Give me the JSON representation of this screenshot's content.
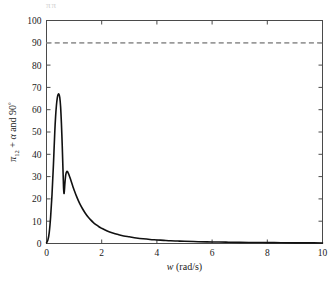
{
  "figure": {
    "top_artifact_text": "ππ",
    "background_color": "#ffffff"
  },
  "chart_data": {
    "type": "line",
    "title": "",
    "xlabel": "w (rad/s)",
    "xlabel_parts": {
      "symbol": "w",
      "unit": "(rad/s)"
    },
    "ylabel": "π12 + α and 90°",
    "ylabel_parts": {
      "pi": "π",
      "subscript": "12",
      "plus": " + ",
      "alpha": "α",
      "and": " and ",
      "ninety": "90",
      "degree": "°"
    },
    "xlim": [
      0,
      10
    ],
    "ylim": [
      0,
      100
    ],
    "xticks": [
      0,
      2,
      4,
      6,
      8,
      10
    ],
    "yticks": [
      0,
      10,
      20,
      30,
      40,
      50,
      60,
      70,
      80,
      90,
      100
    ],
    "xticklabels": [
      "0",
      "2",
      "4",
      "6",
      "8",
      "10"
    ],
    "yticklabels": [
      "0",
      "10",
      "20",
      "30",
      "40",
      "50",
      "60",
      "70",
      "80",
      "90",
      "100"
    ],
    "grid": false,
    "legend": null,
    "series": [
      {
        "name": "π12 + α",
        "style": "solid",
        "color": "#111111",
        "linewidth": 1.6,
        "x": [
          0.0,
          0.05,
          0.1,
          0.15,
          0.2,
          0.25,
          0.3,
          0.33,
          0.36,
          0.39,
          0.42,
          0.45,
          0.48,
          0.51,
          0.54,
          0.57,
          0.59,
          0.61,
          0.62,
          0.635,
          0.65,
          0.67,
          0.7,
          0.74,
          0.78,
          0.82,
          0.86,
          0.9,
          0.95,
          1.0,
          1.1,
          1.2,
          1.3,
          1.4,
          1.5,
          1.6,
          1.7,
          1.8,
          1.9,
          2.0,
          2.2,
          2.4,
          2.6,
          2.8,
          3.0,
          3.25,
          3.5,
          3.75,
          4.0,
          4.25,
          4.5,
          4.75,
          5.0,
          5.5,
          6.0,
          6.5,
          7.0,
          7.5,
          8.0,
          8.5,
          9.0,
          9.5,
          10.0
        ],
        "y": [
          0.3,
          1.5,
          5.0,
          12.0,
          22.0,
          35.0,
          50.0,
          57.0,
          62.0,
          65.2,
          66.8,
          67.0,
          65.5,
          61.5,
          54.0,
          44.0,
          36.0,
          28.0,
          24.5,
          22.4,
          24.0,
          27.5,
          31.0,
          32.3,
          31.8,
          30.6,
          29.2,
          27.7,
          25.8,
          24.0,
          20.8,
          18.0,
          15.7,
          13.7,
          12.0,
          10.6,
          9.4,
          8.4,
          7.5,
          6.8,
          5.6,
          4.7,
          4.0,
          3.4,
          3.0,
          2.5,
          2.1,
          1.8,
          1.6,
          1.4,
          1.2,
          1.1,
          1.0,
          0.8,
          0.7,
          0.6,
          0.5,
          0.45,
          0.4,
          0.35,
          0.3,
          0.28,
          0.25
        ]
      },
      {
        "name": "90°",
        "style": "dashed",
        "color": "#9a9a9a",
        "linewidth": 1.7,
        "constant_y": 90,
        "x": [
          0,
          10
        ],
        "y": [
          90,
          90
        ]
      }
    ],
    "annotations": {
      "peak_primary": {
        "x": 0.45,
        "y": 67
      },
      "local_minimum": {
        "x": 0.635,
        "y": 22.4
      },
      "peak_secondary": {
        "x": 0.74,
        "y": 32.3
      },
      "reference_level": 90
    }
  }
}
